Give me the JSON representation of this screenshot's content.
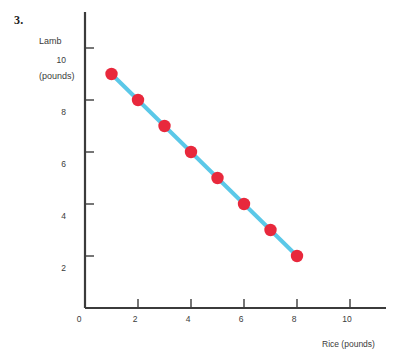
{
  "problem": {
    "number": "3."
  },
  "axis_titles": {
    "y_line1": "Lamb",
    "y_line2": "(pounds)",
    "x": "Rice (pounds)"
  },
  "ticks": {
    "y": [
      "10",
      "8",
      "6",
      "4",
      "2"
    ],
    "x": [
      "2",
      "4",
      "6",
      "8",
      "10"
    ],
    "origin": "0"
  },
  "chart_data": {
    "type": "line",
    "title": "",
    "xlabel": "Rice (pounds)",
    "ylabel": "Lamb (pounds)",
    "xlim": [
      0,
      11.3
    ],
    "ylim": [
      0,
      11.4
    ],
    "xticks": [
      2,
      4,
      6,
      8,
      10
    ],
    "yticks": [
      2,
      4,
      6,
      8,
      10
    ],
    "grid": false,
    "legend": false,
    "markers": true,
    "marker_color": "#e8283c",
    "line_color": "#5bc8e8",
    "axis_color": "#3b3b3b",
    "series": [
      {
        "name": "Lamb vs Rice budget line",
        "x": [
          1,
          2,
          3,
          4,
          5,
          6,
          7,
          8
        ],
        "y": [
          9,
          8,
          7,
          6,
          5,
          4,
          3,
          2
        ],
        "points": [
          {
            "x": 1,
            "y": 9
          },
          {
            "x": 2,
            "y": 8
          },
          {
            "x": 3,
            "y": 7
          },
          {
            "x": 4,
            "y": 6
          },
          {
            "x": 5,
            "y": 5
          },
          {
            "x": 6,
            "y": 4
          },
          {
            "x": 7,
            "y": 3
          },
          {
            "x": 8,
            "y": 2
          }
        ]
      }
    ]
  }
}
